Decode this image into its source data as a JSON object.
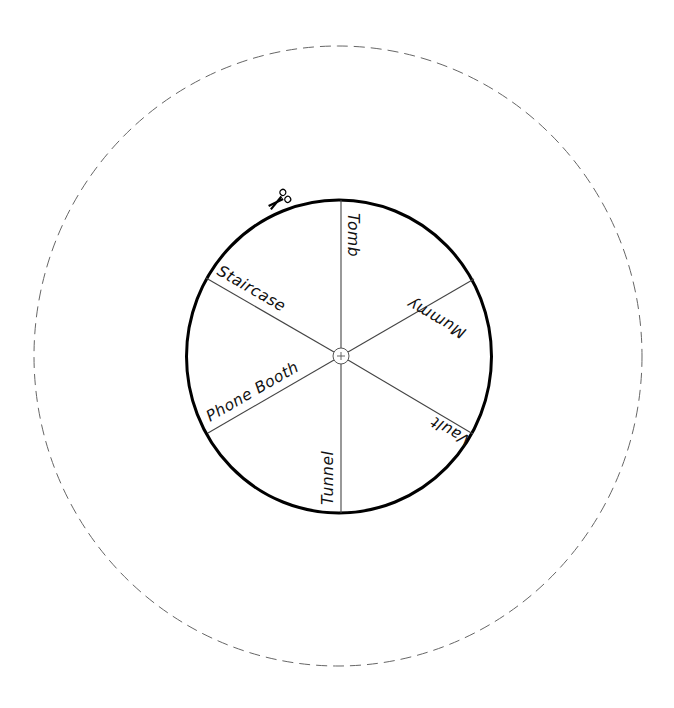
{
  "diagram": {
    "type": "spinner-wheel-cutout",
    "outer_cut_line": {
      "style": "dashed",
      "color": "#555555"
    },
    "wheel": {
      "border_color": "#000000",
      "spoke_color": "#444444"
    },
    "center_mark": "+",
    "cut_icon": "scissors-icon",
    "segments": [
      {
        "label": "Tomb"
      },
      {
        "label": "Mummy"
      },
      {
        "label": "Vault"
      },
      {
        "label": "Tunnel"
      },
      {
        "label": "Phone Booth"
      },
      {
        "label": "Staircase"
      }
    ]
  }
}
